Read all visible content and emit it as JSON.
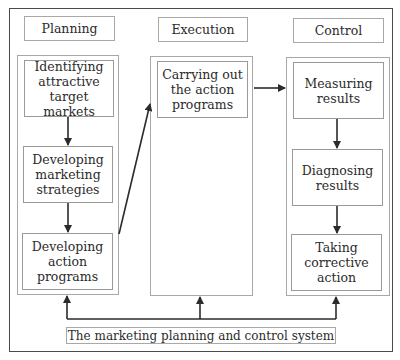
{
  "diagram": {
    "title": "The marketing planning and control system",
    "columns": [
      {
        "header": "Planning",
        "steps": [
          "Identifying attractive target markets",
          "Developing marketing strategies",
          "Developing action programs"
        ]
      },
      {
        "header": "Execution",
        "steps": [
          "Carrying out the action programs"
        ]
      },
      {
        "header": "Control",
        "steps": [
          "Measuring results",
          "Diagnosing results",
          "Taking corrective action"
        ]
      }
    ],
    "connections": [
      {
        "from": "Identifying attractive target markets",
        "to": "Developing marketing strategies"
      },
      {
        "from": "Developing marketing strategies",
        "to": "Developing action programs"
      },
      {
        "from": "Developing action programs",
        "to": "Carrying out the action programs"
      },
      {
        "from": "Carrying out the action programs",
        "to": "Measuring results"
      },
      {
        "from": "Measuring results",
        "to": "Diagnosing results"
      },
      {
        "from": "Diagnosing results",
        "to": "Taking corrective action"
      },
      {
        "from": "feedback-line",
        "to": "Planning"
      },
      {
        "from": "feedback-line",
        "to": "Execution"
      },
      {
        "from": "feedback-line",
        "to": "Control"
      }
    ],
    "colors": {
      "line": "#2b2b2b",
      "box_border": "#9a9a9a",
      "outer_border": "#4a4a4a"
    }
  }
}
